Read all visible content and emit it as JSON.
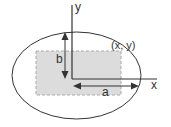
{
  "diagram": {
    "labels": {
      "y_axis": "y",
      "x_axis": "x",
      "semi_minor": "b",
      "semi_major": "a",
      "point": "(x, y)"
    },
    "colors": {
      "stroke": "#333333",
      "rect_fill": "#dcdcdc",
      "rect_stroke": "#aaaaaa",
      "background": "#ffffff"
    }
  }
}
